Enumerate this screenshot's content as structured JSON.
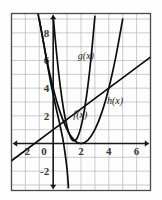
{
  "figure": {
    "name": "coordinate-graph",
    "background_color": "#fdfdfd",
    "frame_color": "#4a4a4a",
    "grid_color": "#b9b5bb",
    "axis_color": "#1a1a1a",
    "curve_color": "#0d0d0d"
  },
  "axes": {
    "x_label": "",
    "y_label": "",
    "xlim": [
      -3,
      7
    ],
    "ylim": [
      -3.4,
      9.4
    ],
    "grid": true,
    "x_tick_values": [
      -2,
      0,
      2,
      4,
      6
    ],
    "x_tick_labels": [
      "-2",
      "0",
      "2",
      "4",
      "6"
    ],
    "y_tick_values": [
      -2,
      2,
      4,
      6,
      8
    ],
    "y_tick_labels": [
      "-2",
      "2",
      "4",
      "6",
      "8"
    ],
    "x_arrows": "both",
    "y_arrows": "both"
  },
  "curve_labels": [
    {
      "text": "g(x)",
      "x": 2.35,
      "y": 6.1
    },
    {
      "text": "h(x)",
      "x": 4.45,
      "y": 2.85
    },
    {
      "text": "f(x)",
      "x": 1.95,
      "y": 1.85
    }
  ],
  "chart_data": {
    "type": "line",
    "title": "",
    "xlabel": "",
    "ylabel": "",
    "xlim": [
      -3,
      7
    ],
    "ylim": [
      -3.4,
      9.4
    ],
    "grid": true,
    "legend": "inline-curve-labels",
    "x_ticks": [
      -2,
      0,
      2,
      4,
      6
    ],
    "y_ticks": [
      -2,
      2,
      4,
      6,
      8
    ],
    "series": [
      {
        "name": "f(x)",
        "type": "parabola",
        "description": "upward parabola with vertex at (2, 0)",
        "equation": "f(x) = (x - 2)^2",
        "points": [
          [
            -1.0,
            9.0
          ],
          [
            -0.5,
            6.25
          ],
          [
            0.0,
            4.0
          ],
          [
            0.5,
            2.25
          ],
          [
            1.0,
            1.0
          ],
          [
            1.5,
            0.25
          ],
          [
            2.0,
            0.0
          ],
          [
            2.5,
            0.25
          ],
          [
            3.0,
            1.0
          ],
          [
            3.5,
            2.25
          ],
          [
            4.0,
            4.0
          ],
          [
            4.5,
            6.25
          ],
          [
            5.0,
            9.0
          ]
        ]
      },
      {
        "name": "g(x)",
        "type": "parabola",
        "description": "narrow steep upward parabola with vertex near (1.5, 0.2)",
        "equation": "g(x) = 4(x - 1.5)^2 + 0.2",
        "points": [
          [
            0.0,
            9.2
          ],
          [
            0.25,
            6.45
          ],
          [
            0.5,
            4.2
          ],
          [
            0.75,
            2.45
          ],
          [
            1.0,
            1.2
          ],
          [
            1.25,
            0.45
          ],
          [
            1.5,
            0.2
          ],
          [
            1.75,
            0.45
          ],
          [
            2.0,
            1.2
          ],
          [
            2.25,
            2.45
          ],
          [
            2.5,
            4.2
          ],
          [
            2.75,
            6.45
          ],
          [
            3.0,
            9.2
          ]
        ]
      },
      {
        "name": "h(x)",
        "type": "line",
        "description": "straight line with positive slope through (0, 1) and (4, 4)",
        "equation": "h(x) = 0.75x + 1",
        "points": [
          [
            -3.0,
            -1.25
          ],
          [
            0.0,
            1.0
          ],
          [
            2.0,
            2.5
          ],
          [
            4.0,
            4.0
          ],
          [
            7.0,
            6.25
          ]
        ]
      },
      {
        "name": "unlabeled-decreasing-curve",
        "type": "curve",
        "description": "steeply decreasing curve from upper left crossing x-axis near x = 0.75",
        "points": [
          [
            -1.1,
            9.4
          ],
          [
            -0.75,
            7.6
          ],
          [
            -0.4,
            5.6
          ],
          [
            -0.1,
            4.0
          ],
          [
            0.2,
            2.6
          ],
          [
            0.45,
            1.5
          ],
          [
            0.7,
            0.3
          ],
          [
            0.85,
            -0.7
          ],
          [
            1.0,
            -1.9
          ],
          [
            1.1,
            -3.2
          ]
        ]
      }
    ]
  }
}
